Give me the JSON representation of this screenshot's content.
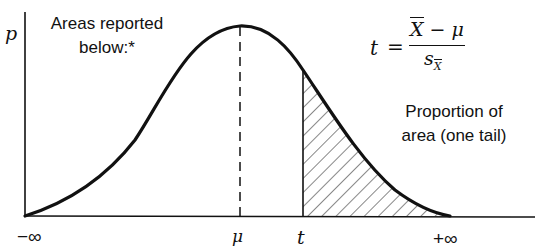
{
  "diagram": {
    "type": "t-distribution one-tail area figure",
    "y_axis_label": "p",
    "note_line1": "Areas reported",
    "note_line2": "below:*",
    "formula": {
      "lhs": "t",
      "equals": "=",
      "numerator_x": "X",
      "numerator_rest": "− μ",
      "denominator_s": "s",
      "denominator_sub": "X"
    },
    "area_label_line1": "Proportion of",
    "area_label_line2": "area (one tail)",
    "x_ticks": {
      "neg_inf": "−∞",
      "mu": "μ",
      "t": "t",
      "pos_inf": "+∞"
    },
    "colors": {
      "ink": "#111111",
      "background": "#ffffff"
    }
  }
}
